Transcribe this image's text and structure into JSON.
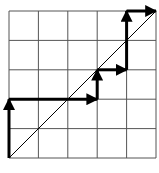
{
  "diagram": {
    "type": "lattice-path",
    "grid": {
      "cols": 5,
      "rows": 5,
      "origin_px": [
        9,
        158
      ],
      "cell_px": 29.4
    },
    "diagonal": {
      "from": [
        0,
        0
      ],
      "to": [
        5,
        5
      ]
    },
    "path": [
      [
        0,
        0
      ],
      [
        0,
        2
      ],
      [
        3,
        2
      ],
      [
        3,
        3
      ],
      [
        4,
        3
      ],
      [
        4,
        5
      ],
      [
        5,
        5
      ]
    ],
    "colors": {
      "grid": "#555555",
      "arrow": "#000000",
      "diagonal": "#000000",
      "background": "#ffffff"
    }
  }
}
